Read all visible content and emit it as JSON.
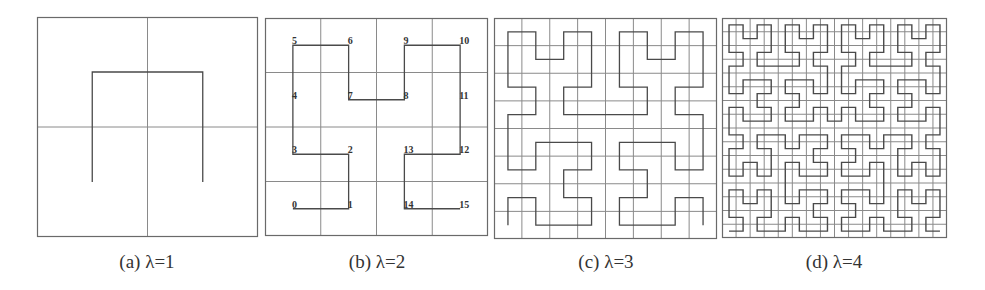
{
  "figure": {
    "panels": [
      {
        "id": "a",
        "caption": "(a) λ=1",
        "order": 1,
        "grid_size": 2,
        "box": {
          "x": 37,
          "y": 17,
          "w": 221,
          "h": 220
        },
        "caption_pos": {
          "x": 147,
          "y": 251
        },
        "show_labels": false,
        "points": [
          [
            0,
            0
          ],
          [
            0,
            1
          ],
          [
            1,
            1
          ],
          [
            1,
            0
          ]
        ]
      },
      {
        "id": "b",
        "caption": "(b) λ=2",
        "order": 2,
        "grid_size": 4,
        "box": {
          "x": 265,
          "y": 18,
          "w": 223,
          "h": 218
        },
        "caption_pos": {
          "x": 377,
          "y": 251
        },
        "show_labels": true,
        "labels": [
          "0",
          "1",
          "2",
          "3",
          "4",
          "5",
          "6",
          "7",
          "8",
          "9",
          "10",
          "11",
          "12",
          "13",
          "14",
          "15"
        ],
        "points": [
          [
            0,
            0
          ],
          [
            1,
            0
          ],
          [
            1,
            1
          ],
          [
            0,
            1
          ],
          [
            0,
            2
          ],
          [
            0,
            3
          ],
          [
            1,
            3
          ],
          [
            1,
            2
          ],
          [
            2,
            2
          ],
          [
            2,
            3
          ],
          [
            3,
            3
          ],
          [
            3,
            2
          ],
          [
            3,
            1
          ],
          [
            2,
            1
          ],
          [
            2,
            0
          ],
          [
            3,
            0
          ]
        ]
      },
      {
        "id": "c",
        "caption": "(c) λ=3",
        "order": 3,
        "grid_size": 8,
        "box": {
          "x": 494,
          "y": 18,
          "w": 223,
          "h": 221
        },
        "caption_pos": {
          "x": 606,
          "y": 251
        },
        "show_labels": false
      },
      {
        "id": "d",
        "caption": "(d) λ=4",
        "order": 4,
        "grid_size": 16,
        "box": {
          "x": 722,
          "y": 18,
          "w": 225,
          "h": 220
        },
        "caption_pos": {
          "x": 834,
          "y": 251
        },
        "show_labels": false
      }
    ],
    "colors": {
      "curve": "#4a4a4a",
      "grid": "#8a8a8a",
      "border": "#6a6a6a",
      "background": "#ffffff"
    }
  },
  "chart_data": {
    "type": "diagram",
    "subfigures": [
      {
        "label": "(a) λ=1",
        "grid": "2x2",
        "curve": "Hilbert order 1",
        "start": "bottom-left",
        "end": "bottom-right"
      },
      {
        "label": "(b) λ=2",
        "grid": "4x4",
        "curve": "Hilbert order 2",
        "cell_index_labels": [
          "0",
          "1",
          "2",
          "3",
          "4",
          "5",
          "6",
          "7",
          "8",
          "9",
          "10",
          "11",
          "12",
          "13",
          "14",
          "15"
        ],
        "start": "bottom-left",
        "end": "bottom-right"
      },
      {
        "label": "(c) λ=3",
        "grid": "8x8",
        "curve": "Hilbert order 3",
        "start": "bottom-left",
        "end": "bottom-right"
      },
      {
        "label": "(d) λ=4",
        "grid": "16x16",
        "curve": "Hilbert order 4",
        "start": "bottom-left",
        "end": "bottom-right"
      }
    ]
  }
}
